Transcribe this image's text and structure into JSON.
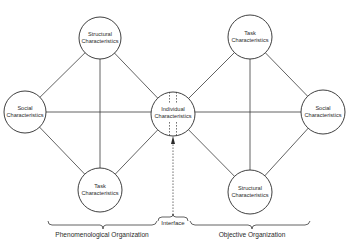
{
  "diagram": {
    "nodes": {
      "left_structural": {
        "line1": "Structural",
        "line2": "Characteristics"
      },
      "left_social": {
        "line1": "Social",
        "line2": "Characteristics"
      },
      "left_task": {
        "line1": "Task",
        "line2": "Characteristics"
      },
      "center_individual": {
        "line1": "Individual",
        "line2": "Characteristics"
      },
      "right_task": {
        "line1": "Task",
        "line2": "Characteristics"
      },
      "right_social": {
        "line1": "Social",
        "line2": "Characteristics"
      },
      "right_structural": {
        "line1": "Structural",
        "line2": "Characteristics"
      }
    },
    "groups": {
      "left": "Phenomenological Organization",
      "interface": "Interface",
      "right": "Objective Organization"
    },
    "colors": {
      "line": "#3a3a3a",
      "background": "#ffffff"
    }
  }
}
